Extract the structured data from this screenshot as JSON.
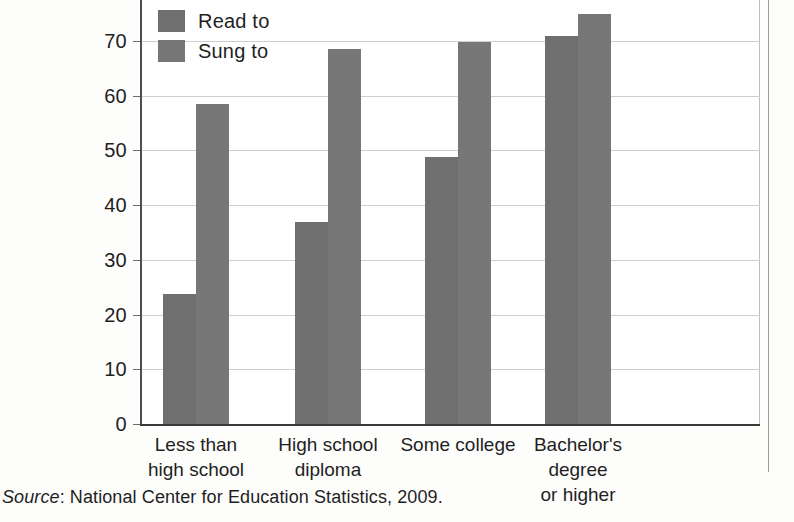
{
  "chart_data": {
    "type": "bar",
    "title": "",
    "subtitle": "",
    "xlabel": "",
    "ylabel": "",
    "categories": [
      "Less than\nhigh school",
      "High school\ndiploma",
      "Some college",
      "Bachelor's degree\nor higher"
    ],
    "series": [
      {
        "name": "Read to",
        "color": "#6f6f6f",
        "values": [
          23.7,
          37.0,
          48.8,
          70.9
        ]
      },
      {
        "name": "Sung to",
        "color": "#777777",
        "values": [
          58.5,
          68.5,
          69.8,
          74.9
        ]
      }
    ],
    "ylim": [
      0,
      74
    ],
    "yticks": [
      0,
      10,
      20,
      30,
      40,
      50,
      60,
      70
    ],
    "ytick_labels": [
      "0",
      "10",
      "20",
      "30",
      "40",
      "50",
      "60",
      "70"
    ],
    "grid": true,
    "legend_position": "top-left-inside"
  },
  "legend": {
    "items": [
      {
        "label": "Read to",
        "swatch": "read"
      },
      {
        "label": "Sung to",
        "swatch": "sung"
      }
    ]
  },
  "caption": {
    "source_word": "Source",
    "source_rest": ": National Center for Education Statistics, 2009."
  }
}
